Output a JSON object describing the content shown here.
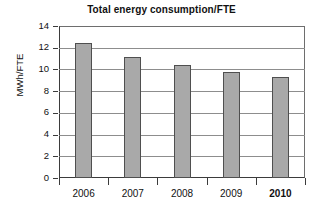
{
  "chart_data": {
    "type": "bar",
    "title": "Total energy consumption/FTE",
    "xlabel": "",
    "ylabel": "MWh/FTE",
    "categories": [
      "2006",
      "2007",
      "2008",
      "2009",
      "2010"
    ],
    "values": [
      12.4,
      11.1,
      10.4,
      9.8,
      9.3
    ],
    "series": [
      {
        "name": "Total energy consumption/FTE",
        "values": [
          12.4,
          11.1,
          10.4,
          9.8,
          9.3
        ]
      }
    ],
    "ylim": [
      0,
      14
    ],
    "yticks": [
      0,
      2,
      4,
      6,
      8,
      10,
      12,
      14
    ],
    "ytick_labels": [
      "0",
      "2",
      "4",
      "6",
      "8",
      "10",
      "12",
      "14"
    ],
    "grid": "horizontal",
    "legend": "none",
    "emphasized_category": "2010",
    "bar_color": "#a9a9a9",
    "bar_border_color": "#4f4f4f",
    "grid_color": "#8d8d8d",
    "axis_color": "#3b3b3b",
    "background_color": "#ffffff"
  }
}
